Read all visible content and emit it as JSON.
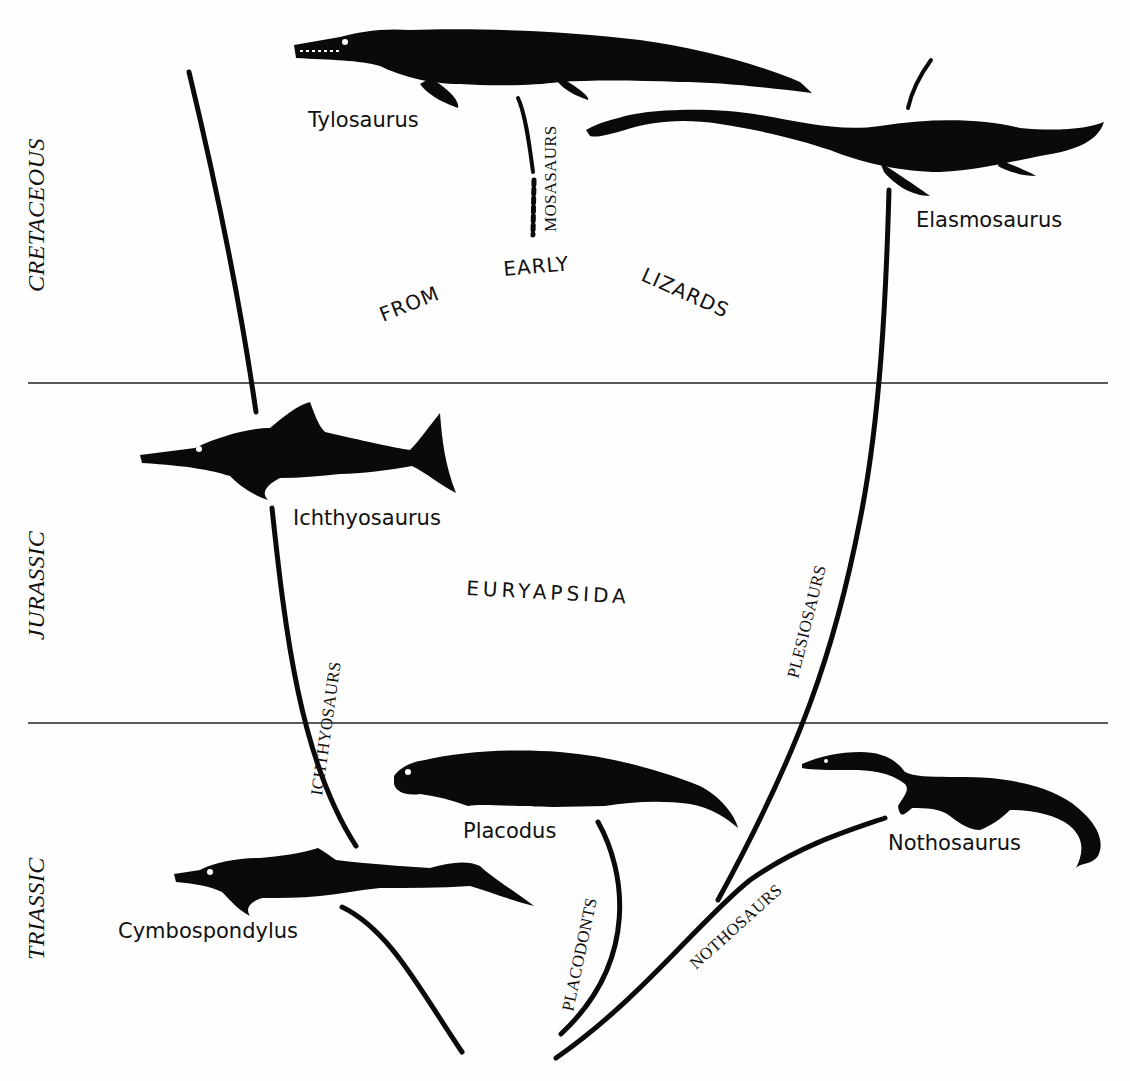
{
  "periods": [
    {
      "label": "CRETACEOUS"
    },
    {
      "label": "JURASSIC"
    },
    {
      "label": "TRIASSIC"
    }
  ],
  "clade": {
    "label": "EURYAPSIDA",
    "origin_words": [
      "FROM",
      "EARLY",
      "LIZARDS"
    ]
  },
  "groups": [
    {
      "label": "MOSASAURS"
    },
    {
      "label": "ICHTHYOSAURS"
    },
    {
      "label": "PLESIOSAURS"
    },
    {
      "label": "PLACODONTS"
    },
    {
      "label": "NOTHOSAURS"
    }
  ],
  "genera": [
    {
      "label": "Tylosaurus"
    },
    {
      "label": "Elasmosaurus"
    },
    {
      "label": "Ichthyosaurus"
    },
    {
      "label": "Placodus"
    },
    {
      "label": "Nothosaurus"
    },
    {
      "label": "Cymbospondylus"
    }
  ],
  "colors": {
    "ink": "#0a0a0a",
    "paper": "#fefefe"
  }
}
